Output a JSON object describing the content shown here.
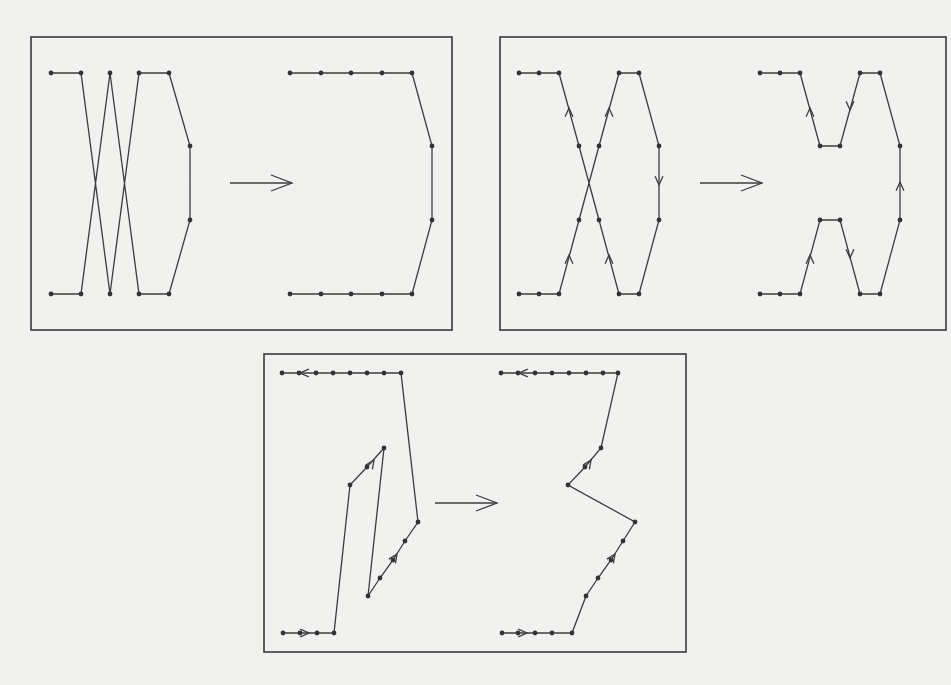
{
  "figure": {
    "colors": {
      "background": "#f1f1ef",
      "ink": "#3c3c3c",
      "frame": "#3a3a3a"
    },
    "panels": [
      {
        "id": "top-left",
        "frame": {
          "x": 31,
          "y": 37,
          "w": 421,
          "h": 293
        },
        "transition_arrow": {
          "x1": 230,
          "y1": 183,
          "x2": 292,
          "y2": 183
        },
        "before": {
          "nodes": [
            [
              51,
              73
            ],
            [
              81,
              73
            ],
            [
              110,
              73
            ],
            [
              139,
              73
            ],
            [
              169,
              73
            ],
            [
              190,
              146
            ],
            [
              190,
              220
            ],
            [
              169,
              294
            ],
            [
              139,
              294
            ],
            [
              110,
              294
            ],
            [
              81,
              294
            ],
            [
              51,
              294
            ]
          ],
          "path": [
            [
              51,
              73
            ],
            [
              81,
              73
            ],
            [
              110,
              294
            ],
            [
              139,
              73
            ],
            [
              169,
              73
            ],
            [
              190,
              146
            ],
            [
              190,
              220
            ],
            [
              169,
              294
            ],
            [
              139,
              294
            ],
            [
              110,
              73
            ],
            [
              81,
              294
            ],
            [
              51,
              294
            ]
          ],
          "direction_arrows": []
        },
        "after": {
          "nodes": [
            [
              290,
              73
            ],
            [
              321,
              73
            ],
            [
              351,
              73
            ],
            [
              382,
              73
            ],
            [
              412,
              73
            ],
            [
              432,
              146
            ],
            [
              432,
              220
            ],
            [
              412,
              294
            ],
            [
              382,
              294
            ],
            [
              351,
              294
            ],
            [
              321,
              294
            ],
            [
              290,
              294
            ]
          ],
          "path": [
            [
              290,
              73
            ],
            [
              321,
              73
            ],
            [
              351,
              73
            ],
            [
              382,
              73
            ],
            [
              412,
              73
            ],
            [
              432,
              146
            ],
            [
              432,
              220
            ],
            [
              412,
              294
            ],
            [
              382,
              294
            ],
            [
              351,
              294
            ],
            [
              321,
              294
            ],
            [
              290,
              294
            ]
          ],
          "direction_arrows": []
        }
      },
      {
        "id": "top-right",
        "frame": {
          "x": 500,
          "y": 37,
          "w": 446,
          "h": 293
        },
        "transition_arrow": {
          "x1": 700,
          "y1": 183,
          "x2": 762,
          "y2": 183
        },
        "before": {
          "nodes": [
            [
              519,
              73
            ],
            [
              539,
              73
            ],
            [
              559,
              73
            ],
            [
              579,
              146
            ],
            [
              599,
              146
            ],
            [
              619,
              73
            ],
            [
              639,
              73
            ],
            [
              659,
              146
            ],
            [
              659,
              220
            ],
            [
              639,
              294
            ],
            [
              619,
              294
            ],
            [
              599,
              220
            ],
            [
              579,
              220
            ],
            [
              559,
              294
            ],
            [
              539,
              294
            ],
            [
              519,
              294
            ]
          ],
          "path": [
            [
              519,
              73
            ],
            [
              539,
              73
            ],
            [
              559,
              73
            ],
            [
              579,
              146
            ],
            [
              599,
              220
            ],
            [
              619,
              294
            ],
            [
              639,
              294
            ],
            [
              659,
              220
            ],
            [
              659,
              146
            ],
            [
              639,
              73
            ],
            [
              619,
              73
            ],
            [
              599,
              146
            ],
            [
              579,
              220
            ],
            [
              559,
              294
            ],
            [
              539,
              294
            ],
            [
              519,
              294
            ]
          ],
          "direction_arrows": [
            {
              "at": [
                569,
                108
              ],
              "dir": "up"
            },
            {
              "at": [
                609,
                108
              ],
              "dir": "up"
            },
            {
              "at": [
                659,
                185
              ],
              "dir": "down"
            },
            {
              "at": [
                569,
                255
              ],
              "dir": "up"
            },
            {
              "at": [
                609,
                255
              ],
              "dir": "up"
            }
          ]
        },
        "after": {
          "nodes": [
            [
              760,
              73
            ],
            [
              780,
              73
            ],
            [
              800,
              73
            ],
            [
              820,
              146
            ],
            [
              840,
              146
            ],
            [
              860,
              73
            ],
            [
              880,
              73
            ],
            [
              900,
              146
            ],
            [
              900,
              220
            ],
            [
              880,
              294
            ],
            [
              860,
              294
            ],
            [
              840,
              220
            ],
            [
              820,
              220
            ],
            [
              800,
              294
            ],
            [
              780,
              294
            ],
            [
              760,
              294
            ]
          ],
          "path_segments": [
            [
              [
                760,
                73
              ],
              [
                780,
                73
              ],
              [
                800,
                73
              ],
              [
                820,
                146
              ],
              [
                840,
                146
              ],
              [
                860,
                73
              ],
              [
                880,
                73
              ],
              [
                900,
                146
              ],
              [
                900,
                220
              ],
              [
                880,
                294
              ],
              [
                860,
                294
              ],
              [
                840,
                220
              ],
              [
                820,
                220
              ],
              [
                800,
                294
              ],
              [
                780,
                294
              ],
              [
                760,
                294
              ]
            ]
          ],
          "direction_arrows": [
            {
              "at": [
                810,
                108
              ],
              "dir": "up"
            },
            {
              "at": [
                850,
                110
              ],
              "dir": "down"
            },
            {
              "at": [
                900,
                182
              ],
              "dir": "up"
            },
            {
              "at": [
                810,
                255
              ],
              "dir": "up"
            },
            {
              "at": [
                850,
                258
              ],
              "dir": "down"
            }
          ]
        }
      },
      {
        "id": "bottom",
        "frame": {
          "x": 264,
          "y": 354,
          "w": 422,
          "h": 298
        },
        "transition_arrow": {
          "x1": 435,
          "y1": 503,
          "x2": 497,
          "y2": 503
        },
        "before": {
          "nodes": [
            [
              282,
              373
            ],
            [
              299,
              373
            ],
            [
              316,
              373
            ],
            [
              333,
              373
            ],
            [
              350,
              373
            ],
            [
              367,
              373
            ],
            [
              384,
              373
            ],
            [
              401,
              373
            ],
            [
              418,
              522
            ],
            [
              405,
              541
            ],
            [
              393,
              560
            ],
            [
              380,
              578
            ],
            [
              368,
              596
            ],
            [
              384,
              448
            ],
            [
              367,
              467
            ],
            [
              350,
              485
            ],
            [
              334,
              633
            ],
            [
              317,
              633
            ],
            [
              300,
              633
            ],
            [
              283,
              633
            ]
          ],
          "path": [
            [
              283,
              633
            ],
            [
              300,
              633
            ],
            [
              317,
              633
            ],
            [
              334,
              633
            ],
            [
              350,
              485
            ],
            [
              367,
              467
            ],
            [
              384,
              448
            ],
            [
              368,
              596
            ],
            [
              380,
              578
            ],
            [
              393,
              560
            ],
            [
              405,
              541
            ],
            [
              418,
              522
            ],
            [
              401,
              373
            ],
            [
              384,
              373
            ],
            [
              367,
              373
            ],
            [
              350,
              373
            ],
            [
              333,
              373
            ],
            [
              316,
              373
            ],
            [
              299,
              373
            ],
            [
              282,
              373
            ]
          ],
          "direction_arrows": [
            {
              "at": [
                300,
                373
              ],
              "dir": "left"
            },
            {
              "at": [
                309,
                633
              ],
              "dir": "right"
            },
            {
              "at": [
                374,
                460
              ],
              "dir": "up-right"
            },
            {
              "at": [
                397,
                554
              ],
              "dir": "up-right"
            }
          ]
        },
        "after": {
          "nodes": [
            [
              501,
              373
            ],
            [
              518,
              373
            ],
            [
              535,
              373
            ],
            [
              552,
              373
            ],
            [
              569,
              373
            ],
            [
              586,
              373
            ],
            [
              603,
              373
            ],
            [
              618,
              373
            ],
            [
              601,
              448
            ],
            [
              585,
              467
            ],
            [
              568,
              485
            ],
            [
              635,
              522
            ],
            [
              623,
              541
            ],
            [
              611,
              560
            ],
            [
              598,
              578
            ],
            [
              586,
              596
            ],
            [
              572,
              633
            ],
            [
              552,
              633
            ],
            [
              535,
              633
            ],
            [
              518,
              633
            ],
            [
              502,
              633
            ]
          ],
          "path": [
            [
              502,
              633
            ],
            [
              518,
              633
            ],
            [
              535,
              633
            ],
            [
              552,
              633
            ],
            [
              572,
              633
            ],
            [
              586,
              596
            ],
            [
              598,
              578
            ],
            [
              611,
              560
            ],
            [
              623,
              541
            ],
            [
              635,
              522
            ],
            [
              568,
              485
            ],
            [
              585,
              467
            ],
            [
              601,
              448
            ],
            [
              618,
              373
            ],
            [
              603,
              373
            ],
            [
              586,
              373
            ],
            [
              569,
              373
            ],
            [
              552,
              373
            ],
            [
              535,
              373
            ],
            [
              518,
              373
            ],
            [
              501,
              373
            ]
          ],
          "direction_arrows": [
            {
              "at": [
                519,
                373
              ],
              "dir": "left"
            },
            {
              "at": [
                527,
                633
              ],
              "dir": "right"
            },
            {
              "at": [
                591,
                460
              ],
              "dir": "up-right"
            },
            {
              "at": [
                615,
                554
              ],
              "dir": "up-right"
            }
          ]
        }
      }
    ]
  }
}
